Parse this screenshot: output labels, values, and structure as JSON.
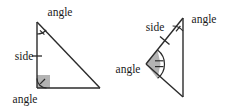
{
  "figure": {
    "name": "two-triangles-congruence-diagram",
    "background_color": "#ffffff",
    "stroke_color": "#2b2b2b",
    "text_color": "#1a1a1a",
    "marker_fill_color": "#b3b3b3",
    "labels": {
      "left_triangle_top_angle": "angle",
      "left_triangle_side": "side",
      "left_triangle_bottom_angle": "angle",
      "right_triangle_top_angle": "angle",
      "right_triangle_side": "side",
      "right_triangle_left_angle": "angle"
    }
  },
  "left_triangle": {
    "name": "left-triangle",
    "vertices": {
      "top": [
        37,
        22
      ],
      "bottom_left": [
        37,
        88
      ],
      "bottom_right": [
        100,
        88
      ]
    },
    "markers": {
      "top_angle_arc": "single-arc-with-tick",
      "side_tick": "single-tick",
      "bottom_left_angle": "right-angle-square-shaded-with-arc-tick"
    }
  },
  "right_triangle": {
    "name": "right-triangle",
    "vertices": {
      "top": [
        183,
        18
      ],
      "left": [
        146,
        64
      ],
      "bottom": [
        183,
        97
      ]
    },
    "markers": {
      "top_angle_arc": "single-arc-with-tick",
      "side_tick": "single-tick",
      "left_angle": "shaded-wedge-with-double-tick"
    }
  }
}
